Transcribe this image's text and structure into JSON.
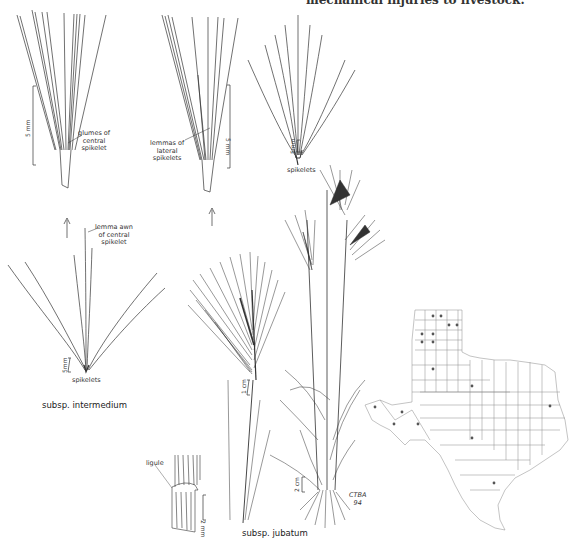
{
  "header": {
    "cut_text": "mechanical injuries to livestock."
  },
  "panels": {
    "glumes_detail": {
      "label": "glumes of\ncentral\nspikelet",
      "scale": "5 mm"
    },
    "lemmas_detail": {
      "label": "lemmas of\nlateral\nspikelets",
      "scale": "5 mm"
    },
    "jubatum_spikelets": {
      "label": "spikelets",
      "scale": "5mm"
    },
    "intermedium_spikelets": {
      "awn_label": "lemma awn\nof central\nspikelet",
      "label": "spikelets",
      "scale": "5mm",
      "caption": "subsp. intermedium"
    },
    "inflorescence": {
      "scale": "1 cm"
    },
    "ligule": {
      "label": "ligule",
      "scale": "2 mm"
    },
    "habit": {
      "scale": "2 cm",
      "signature": "CTBA\n94"
    },
    "jubatum_caption": "subsp. jubatum"
  },
  "map": {
    "title": "Texas county distribution map",
    "point_color": "#555555",
    "points": [
      [
        433,
        316
      ],
      [
        441,
        316
      ],
      [
        449,
        325
      ],
      [
        457,
        325
      ],
      [
        422,
        334
      ],
      [
        433,
        334
      ],
      [
        422,
        342
      ],
      [
        433,
        342
      ],
      [
        433,
        369
      ],
      [
        472,
        386
      ],
      [
        375,
        407
      ],
      [
        402,
        412
      ],
      [
        394,
        424
      ],
      [
        418,
        424
      ],
      [
        472,
        438
      ],
      [
        550,
        406
      ],
      [
        494,
        483
      ]
    ]
  },
  "colors": {
    "ink": "#333333",
    "background": "#ffffff"
  }
}
